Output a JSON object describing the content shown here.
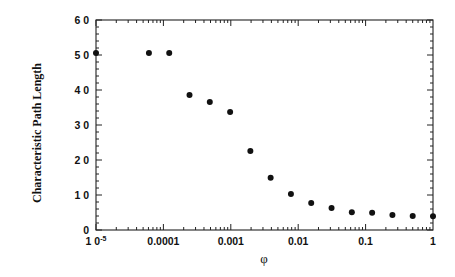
{
  "chart_data": {
    "type": "scatter",
    "title": "",
    "xlabel": "φ",
    "ylabel": "Characteristic Path Length",
    "xscale": "log",
    "xlim": [
      1e-05,
      1
    ],
    "ylim": [
      0,
      60
    ],
    "grid": false,
    "legend": null,
    "x_ticks": [
      {
        "value": 1e-05,
        "label": "1 0",
        "sup": "-5"
      },
      {
        "value": 0.0001,
        "label": "0.0001"
      },
      {
        "value": 0.001,
        "label": "0.001"
      },
      {
        "value": 0.01,
        "label": "0.01"
      },
      {
        "value": 0.1,
        "label": "0.1"
      },
      {
        "value": 1,
        "label": "1"
      }
    ],
    "y_ticks": [
      {
        "value": 0,
        "label": "0"
      },
      {
        "value": 10,
        "label": "1 0"
      },
      {
        "value": 20,
        "label": "2 0"
      },
      {
        "value": 30,
        "label": "3 0"
      },
      {
        "value": 40,
        "label": "4 0"
      },
      {
        "value": 50,
        "label": "5 0"
      },
      {
        "value": 60,
        "label": "6 0"
      }
    ],
    "series": [
      {
        "name": "L(φ)",
        "marker": "filled-circle",
        "color": "#111111",
        "x": [
          1e-05,
          6.1e-05,
          0.000122,
          0.000244,
          0.000488,
          0.000977,
          0.00195,
          0.0039,
          0.0078,
          0.0156,
          0.03125,
          0.0625,
          0.125,
          0.25,
          0.5,
          1
        ],
        "y": [
          50.6,
          50.6,
          50.6,
          38.6,
          36.6,
          33.7,
          22.6,
          14.9,
          10.3,
          7.7,
          6.3,
          5.1,
          4.9,
          4.3,
          4.0,
          3.9
        ]
      }
    ]
  }
}
